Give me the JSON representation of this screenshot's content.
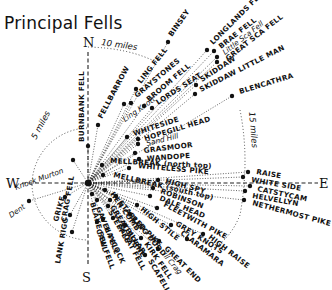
{
  "title": "Principal Fells",
  "compass": {
    "north": "N",
    "south": "S",
    "east": "E",
    "west": "W"
  },
  "distance_rings": [
    {
      "label": "5 miles",
      "radius_miles": 5
    },
    {
      "label": "10 miles",
      "radius_miles": 10
    },
    {
      "label": "15 miles",
      "radius_miles": 15
    }
  ],
  "centre": {
    "x": 88,
    "y": 183
  },
  "colors": {
    "ink": "#111111",
    "background": "#ffffff"
  },
  "fells": [
    {
      "name": "BURNBANK FELL",
      "x": 88,
      "y": 146,
      "lx": 84,
      "ly": 142,
      "rot": -90,
      "style": "caps"
    },
    {
      "name": "FELLBARROW",
      "x": 98,
      "y": 125,
      "lx": 102,
      "ly": 119,
      "rot": -62,
      "style": "caps"
    },
    {
      "name": "LING FELL",
      "x": 136,
      "y": 89,
      "lx": 141,
      "ly": 84,
      "rot": -52,
      "style": "caps"
    },
    {
      "name": "BINSEY",
      "x": 168,
      "y": 42,
      "lx": 172,
      "ly": 37,
      "rot": -55,
      "style": "caps"
    },
    {
      "name": "Embleton / Eating Knott",
      "x": 124,
      "y": 104,
      "lx": 125,
      "ly": 122,
      "rot": -35,
      "style": "script",
      "display": "Ling Knott"
    },
    {
      "name": "GRAYSTONES",
      "x": 131,
      "y": 103,
      "lx": 137,
      "ly": 98,
      "rot": -40,
      "style": "caps"
    },
    {
      "name": "BROOM FELL",
      "x": 144,
      "y": 106,
      "lx": 149,
      "ly": 102,
      "rot": -40,
      "style": "caps"
    },
    {
      "name": "LORDS SEAT",
      "x": 152,
      "y": 108,
      "lx": 158,
      "ly": 105,
      "rot": -33,
      "style": "caps"
    },
    {
      "name": "LONGLANDS FELL",
      "x": 207,
      "y": 50,
      "lx": 213,
      "ly": 45,
      "rot": -45,
      "style": "caps"
    },
    {
      "name": "BRAE FELL",
      "x": 214,
      "y": 51,
      "lx": 221,
      "ly": 49,
      "rot": -38,
      "style": "caps"
    },
    {
      "name": "Little Sca Fell",
      "x": 217,
      "y": 57,
      "lx": 225,
      "ly": 55,
      "rot": -38,
      "style": "script"
    },
    {
      "name": "GREAT SCA FELL",
      "x": 217,
      "y": 62,
      "lx": 228,
      "ly": 61,
      "rot": -38,
      "style": "caps"
    },
    {
      "name": "SKIDDAW",
      "x": 196,
      "y": 85,
      "lx": 202,
      "ly": 82,
      "rot": -33,
      "style": "caps"
    },
    {
      "name": "SKIDDAW LITTLE MAN",
      "x": 195,
      "y": 94,
      "lx": 201,
      "ly": 92,
      "rot": -27,
      "style": "caps"
    },
    {
      "name": "BLENCATHRA",
      "x": 232,
      "y": 96,
      "lx": 240,
      "ly": 94,
      "rot": -17,
      "style": "caps"
    },
    {
      "name": "WHITESIDE",
      "x": 127,
      "y": 137,
      "lx": 134,
      "ly": 136,
      "rot": -18,
      "style": "caps"
    },
    {
      "name": "HOPEGILL HEAD",
      "x": 138,
      "y": 139,
      "lx": 145,
      "ly": 141,
      "rot": -17,
      "style": "caps"
    },
    {
      "name": "Sand Hill",
      "x": 138,
      "y": 144,
      "lx": 147,
      "ly": 146,
      "rot": -14,
      "style": "script"
    },
    {
      "name": "GRASMOOR",
      "x": 135,
      "y": 153,
      "lx": 144,
      "ly": 153,
      "rot": -7,
      "style": "caps"
    },
    {
      "name": "WANDOPE",
      "x": 139,
      "y": 159,
      "lx": 147,
      "ly": 161,
      "rot": -4,
      "style": "caps"
    },
    {
      "name": "MELLBREAK (north top)",
      "x": 102,
      "y": 165,
      "lx": 110,
      "ly": 163,
      "rot": 3,
      "style": "mixed"
    },
    {
      "name": "WHITELESS PIKE",
      "x": 129,
      "y": 168,
      "lx": 138,
      "ly": 168,
      "rot": 5,
      "style": "caps"
    },
    {
      "name": "RAISE",
      "x": 248,
      "y": 172,
      "lx": 256,
      "ly": 174,
      "rot": 10,
      "style": "caps"
    },
    {
      "name": "WHITE SIDE",
      "x": 243,
      "y": 177,
      "lx": 251,
      "ly": 182,
      "rot": 10,
      "style": "caps"
    },
    {
      "name": "MELLBREAK (south top)",
      "x": 103,
      "y": 175,
      "lx": 113,
      "ly": 177,
      "rot": 13,
      "style": "mixed"
    },
    {
      "name": "HIGH SPY",
      "x": 158,
      "y": 180,
      "lx": 165,
      "ly": 183,
      "rot": 15,
      "style": "caps"
    },
    {
      "name": "CATSTYCAM",
      "x": 250,
      "y": 186,
      "lx": 257,
      "ly": 191,
      "rot": 12,
      "style": "caps"
    },
    {
      "name": "HELVELLYN",
      "x": 245,
      "y": 191,
      "lx": 252,
      "ly": 198,
      "rot": 10,
      "style": "caps"
    },
    {
      "name": "NETHERMOST PIKE",
      "x": 244,
      "y": 200,
      "lx": 252,
      "ly": 205,
      "rot": 15,
      "style": "caps"
    },
    {
      "name": "ROBINSON",
      "x": 153,
      "y": 188,
      "lx": 160,
      "ly": 193,
      "rot": 20,
      "style": "caps"
    },
    {
      "name": "DALE HEAD",
      "x": 150,
      "y": 196,
      "lx": 159,
      "ly": 200,
      "rot": 22,
      "style": "caps"
    },
    {
      "name": "FLEETWITH PIKE",
      "x": 157,
      "y": 208,
      "lx": 163,
      "ly": 206,
      "rot": 28,
      "style": "caps"
    },
    {
      "name": "GREY KNOTS",
      "x": 171,
      "y": 225,
      "lx": 175,
      "ly": 225,
      "rot": 32,
      "style": "caps"
    },
    {
      "name": "HIGH RAISE",
      "x": 203,
      "y": 234,
      "lx": 208,
      "ly": 238,
      "rot": 38,
      "style": "caps"
    },
    {
      "name": "CLARAMARA",
      "x": 187,
      "y": 239,
      "lx": 180,
      "ly": 234,
      "rot": 38,
      "style": "caps"
    },
    {
      "name": "GREAT END",
      "x": 159,
      "y": 241,
      "lx": 164,
      "ly": 249,
      "rot": 45,
      "style": "caps"
    },
    {
      "name": "Ill Crag",
      "x": 158,
      "y": 249,
      "lx": 162,
      "ly": 255,
      "rot": 50,
      "style": "script"
    },
    {
      "name": "SCAFELL",
      "x": 145,
      "y": 255,
      "lx": 148,
      "ly": 261,
      "rot": 60,
      "style": "caps"
    },
    {
      "name": "HIGH STILE",
      "x": 137,
      "y": 205,
      "lx": 140,
      "ly": 210,
      "rot": 40,
      "style": "caps"
    },
    {
      "name": "RED PIKE",
      "x": 130,
      "y": 214,
      "lx": 131,
      "ly": 219,
      "rot": 45,
      "style": "caps"
    },
    {
      "name": "PILLAR",
      "x": 125,
      "y": 225,
      "lx": 125,
      "ly": 230,
      "rot": 55,
      "style": "caps"
    },
    {
      "name": "KIRK FELL",
      "x": 141,
      "y": 238,
      "lx": 144,
      "ly": 244,
      "rot": 55,
      "style": "caps"
    },
    {
      "name": "SCOAT FELL",
      "x": 113,
      "y": 218,
      "lx": 118,
      "ly": 226,
      "rot": 62,
      "style": "caps"
    },
    {
      "name": "STEEPLE",
      "x": 108,
      "y": 206,
      "lx": 108,
      "ly": 212,
      "rot": 60,
      "style": "caps"
    },
    {
      "name": "HAYCOCK",
      "x": 103,
      "y": 219,
      "lx": 104,
      "ly": 228,
      "rot": 65,
      "style": "caps"
    },
    {
      "name": "CAW FELL",
      "x": 97,
      "y": 222,
      "lx": 96,
      "ly": 230,
      "rot": 70,
      "style": "caps"
    },
    {
      "name": "GAVEL FELL",
      "x": 97,
      "y": 200,
      "lx": 96,
      "ly": 208,
      "rot": 68,
      "style": "caps"
    },
    {
      "name": "HEN COMB",
      "x": 105,
      "y": 190,
      "lx": 110,
      "ly": 194,
      "rot": 55,
      "style": "caps"
    },
    {
      "name": "BLAKE FELL",
      "x": 92,
      "y": 194,
      "lx": 90,
      "ly": 203,
      "rot": 75,
      "style": "caps"
    },
    {
      "name": "STARLING DODD",
      "x": 116,
      "y": 196,
      "lx": 118,
      "ly": 203,
      "rot": 50,
      "style": "caps"
    },
    {
      "name": "GREAT BORNE",
      "x": 110,
      "y": 200,
      "lx": 110,
      "ly": 207,
      "rot": 58,
      "style": "caps"
    },
    {
      "name": "CRAG FELL",
      "x": 70,
      "y": 215,
      "lx": 66,
      "ly": 222,
      "rot": -80,
      "style": "caps"
    },
    {
      "name": "GRIKE",
      "x": 65,
      "y": 197,
      "lx": 58,
      "ly": 222,
      "rot": -75,
      "style": "caps"
    },
    {
      "name": "LANK RIGG",
      "x": 72,
      "y": 232,
      "lx": 60,
      "ly": 264,
      "rot": -80,
      "style": "caps"
    },
    {
      "name": "Knock Murton",
      "x": 73,
      "y": 160,
      "lx": 16,
      "ly": 190,
      "rot": -20,
      "style": "script"
    },
    {
      "name": "Dent",
      "x": 29,
      "y": 201,
      "lx": 11,
      "ly": 218,
      "rot": -35,
      "style": "script"
    }
  ]
}
